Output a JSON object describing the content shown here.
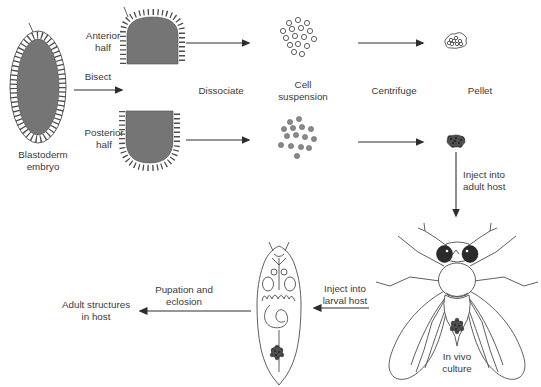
{
  "figure": {
    "labels": {
      "blastoderm_embryo": {
        "line1": "Blastoderm",
        "line2": "embryo"
      },
      "anterior_half": {
        "line1": "Anterior",
        "line2": "half"
      },
      "bisect": "Bisect",
      "posterior_half": {
        "line1": "Posterior",
        "line2": "half"
      },
      "dissociate": "Dissociate",
      "cell_suspension": {
        "line1": "Cell",
        "line2": "suspension"
      },
      "centrifuge": "Centrifuge",
      "pellet": "Pellet",
      "inject_adult": {
        "line1": "Inject into",
        "line2": "adult host"
      },
      "in_vivo_culture": {
        "line1": "In vivo",
        "line2": "culture"
      },
      "inject_larval": {
        "line1": "Inject into",
        "line2": "larval host"
      },
      "pupation_eclosion": {
        "line1": "Pupation and",
        "line2": "eclosion"
      },
      "adult_structures": {
        "line1": "Adult structures",
        "line2": "in host"
      }
    },
    "colors": {
      "background": "#ffffff",
      "text": "#3a3a3a",
      "line": "#2e2e2e",
      "outline": "#4d4d4d",
      "embryo_fill": "#757575",
      "cell_fill": "#8a8a8a",
      "pellet_fill": "#4f4f4f",
      "eye_fill": "#2b2b2b"
    }
  }
}
